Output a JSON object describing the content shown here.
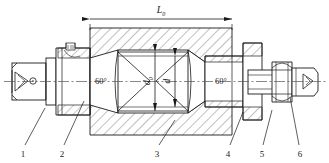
{
  "drawing": {
    "title": "Workpiece mounted between 60-degree centers on a mandrel",
    "type": "mechanical-sectional-assembly-drawing",
    "background_color": "#ffffff",
    "line_color": "#1a1a1a",
    "hatch_color": "#4a4a4a",
    "centerline_color": "#555555"
  },
  "dimensions": {
    "length": {
      "label": "L",
      "subscript": "0",
      "name": "overall-length-dimension",
      "orientation": "horizontal",
      "position": "top"
    },
    "outer_diameter": {
      "label": "d",
      "subscript": "0",
      "name": "outer-diameter-dimension",
      "orientation": "vertical",
      "position": "center-left"
    },
    "inner_diameter": {
      "label": "d",
      "subscript": "",
      "name": "inner-diameter-dimension",
      "orientation": "vertical",
      "position": "center-right"
    }
  },
  "angles": {
    "left_center": {
      "label": "60°",
      "name": "left-center-angle"
    },
    "right_center": {
      "label": "60°",
      "name": "right-center-angle"
    }
  },
  "callouts": [
    {
      "number": "1",
      "name": "callout-1",
      "x": 23,
      "label_y": 155,
      "leader_to_x": 45,
      "leader_to_y": 108
    },
    {
      "number": "2",
      "name": "callout-2",
      "x": 62,
      "label_y": 155,
      "leader_to_x": 84,
      "leader_to_y": 101
    },
    {
      "number": "3",
      "name": "callout-3",
      "x": 157,
      "label_y": 155,
      "leader_to_x": 175,
      "leader_to_y": 120
    },
    {
      "number": "4",
      "name": "callout-4",
      "x": 228,
      "label_y": 155,
      "leader_to_x": 243,
      "leader_to_y": 112
    },
    {
      "number": "5",
      "name": "callout-5",
      "x": 262,
      "label_y": 155,
      "leader_to_x": 272,
      "leader_to_y": 110
    },
    {
      "number": "6",
      "name": "callout-6",
      "x": 300,
      "label_y": 155,
      "leader_to_x": 290,
      "leader_to_y": 97
    }
  ]
}
